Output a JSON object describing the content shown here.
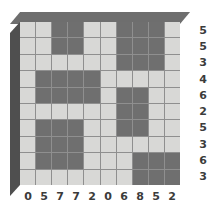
{
  "chart_data": {
    "type": "heatmap",
    "title": "",
    "subtitle": "",
    "xlabel": "",
    "ylabel": "",
    "grid": true,
    "legend": "none",
    "rows": 10,
    "cols": 10,
    "value_meaning": "1 = dark filled cell, 0 = light empty cell",
    "colors": {
      "filled": "#6f6f6f",
      "empty": "#d8d8d6",
      "gridline": "#8f8f8f",
      "block_top": "#6e6e6e",
      "block_side": "#4f4f4f",
      "label_text": "#3b3b3b",
      "background": "#ffffff"
    },
    "matrix": [
      [
        0,
        0,
        1,
        1,
        0,
        0,
        1,
        1,
        1,
        0
      ],
      [
        0,
        0,
        1,
        1,
        0,
        0,
        1,
        1,
        1,
        0
      ],
      [
        0,
        0,
        0,
        0,
        0,
        0,
        1,
        1,
        1,
        0
      ],
      [
        0,
        1,
        1,
        1,
        1,
        0,
        0,
        0,
        0,
        0
      ],
      [
        0,
        1,
        1,
        1,
        1,
        0,
        1,
        1,
        0,
        0
      ],
      [
        0,
        0,
        0,
        0,
        0,
        0,
        1,
        1,
        0,
        0
      ],
      [
        0,
        1,
        1,
        1,
        0,
        0,
        1,
        1,
        0,
        0
      ],
      [
        0,
        1,
        1,
        1,
        0,
        0,
        0,
        0,
        0,
        0
      ],
      [
        0,
        1,
        1,
        1,
        0,
        0,
        0,
        1,
        1,
        1
      ],
      [
        0,
        0,
        0,
        0,
        0,
        0,
        0,
        1,
        1,
        1
      ]
    ],
    "row_labels": [
      "5",
      "5",
      "3",
      "4",
      "6",
      "2",
      "5",
      "3",
      "6",
      "3"
    ],
    "col_labels": [
      "0",
      "5",
      "7",
      "7",
      "2",
      "0",
      "6",
      "8",
      "5",
      "2"
    ],
    "row_label_meaning": "count of dark cells in each row",
    "col_label_meaning": "count of dark cells in each column"
  }
}
